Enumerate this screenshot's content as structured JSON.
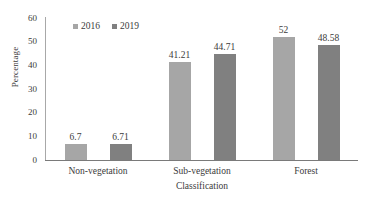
{
  "chart_data": {
    "type": "bar",
    "title": "",
    "xlabel": "Classification",
    "ylabel": "Percentage",
    "categories": [
      "Non-vegetation",
      "Sub-vegetation",
      "Forest"
    ],
    "series": [
      {
        "name": "2016",
        "color": "#a6a6a6",
        "values": [
          6.7,
          41.21,
          52
        ]
      },
      {
        "name": "2019",
        "color": "#808080",
        "values": [
          6.71,
          44.71,
          48.58
        ]
      }
    ],
    "value_labels": [
      [
        "6.7",
        "41.21",
        "52"
      ],
      [
        "6.71",
        "44.71",
        "48.58"
      ]
    ],
    "ylim": [
      0,
      60
    ],
    "yticks": [
      0,
      10,
      20,
      30,
      40,
      50,
      60
    ],
    "ytick_labels": [
      "0",
      "10",
      "20",
      "30",
      "40",
      "50",
      "60"
    ],
    "grid": false,
    "legend_position": "top-left-inside",
    "axis_color": "#7a7a7a",
    "text_color": "#3b3b3b",
    "background": "#ffffff"
  }
}
